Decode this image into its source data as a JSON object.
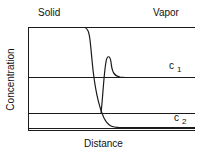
{
  "diagram": {
    "region_labels": {
      "left": "Solid",
      "right": "Vapor"
    },
    "axes": {
      "xlabel": "Distance",
      "ylabel": "Concentration"
    },
    "levels": [
      {
        "name": "c",
        "subscript": "1"
      },
      {
        "name": "c",
        "subscript": "2"
      }
    ],
    "colors": {
      "line": "#1a1a1a",
      "background": "#ffffff"
    }
  }
}
